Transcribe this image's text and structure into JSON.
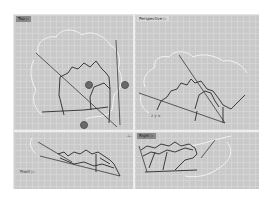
{
  "viewports": {
    "top": {
      "label": "Top ▷",
      "active": true
    },
    "perspective": {
      "label": "Perspective ▷"
    },
    "front": {
      "label": "Front ▷"
    },
    "right": {
      "label": "Right ▷"
    }
  },
  "splitter_handle": "⊥,",
  "axes_icon": "z y x",
  "colors": {
    "viewport_bg": "#c9c9c9",
    "grid_line": "#d4d4d4",
    "curve": "#2a2a2a",
    "outline": "#f2f2f2",
    "control_point": "#6a6a6a",
    "active_label_bg": "#8a8a8a"
  }
}
